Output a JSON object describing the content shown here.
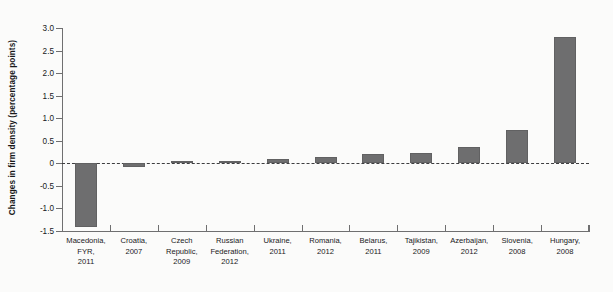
{
  "chart_data": {
    "type": "bar",
    "title": "",
    "xlabel": "",
    "ylabel": "Changes in firm density (percentage points)",
    "ylim": [
      -1.5,
      3.0
    ],
    "yticks": [
      "3.0",
      "2.5",
      "2.0",
      "1.5",
      "1.0",
      "0.5",
      "0",
      "-0.5",
      "-1.0",
      "-1.5"
    ],
    "ytick_values": [
      3.0,
      2.5,
      2.0,
      1.5,
      1.0,
      0.5,
      0,
      -0.5,
      -1.0,
      -1.5
    ],
    "grid": false,
    "legend": null,
    "zero_reference_line": 0,
    "bar_color": "#6e6e6f",
    "categories": [
      "Macedonia, FYR, 2011",
      "Croatia, 2007",
      "Czech Republic, 2009",
      "Russian Federation, 2012",
      "Ukraine, 2011",
      "Romania, 2012",
      "Belarus, 2011",
      "Tajikistan, 2009",
      "Azerbaijan, 2012",
      "Slovenia, 2008",
      "Hungary, 2008"
    ],
    "category_lines": [
      [
        "Macedonia,",
        "FYR,",
        "2011"
      ],
      [
        "Croatia,",
        "2007"
      ],
      [
        "Czech",
        "Republic,",
        "2009"
      ],
      [
        "Russian",
        "Federation,",
        "2012"
      ],
      [
        "Ukraine,",
        "2011"
      ],
      [
        "Romania,",
        "2012"
      ],
      [
        "Belarus,",
        "2011"
      ],
      [
        "Tajikistan,",
        "2009"
      ],
      [
        "Azerbaijan,",
        "2012"
      ],
      [
        "Slovenia,",
        "2008"
      ],
      [
        "Hungary,",
        "2008"
      ]
    ],
    "values": [
      -1.42,
      -0.09,
      0.02,
      0.02,
      0.1,
      0.14,
      0.2,
      0.22,
      0.36,
      0.73,
      2.8
    ]
  }
}
